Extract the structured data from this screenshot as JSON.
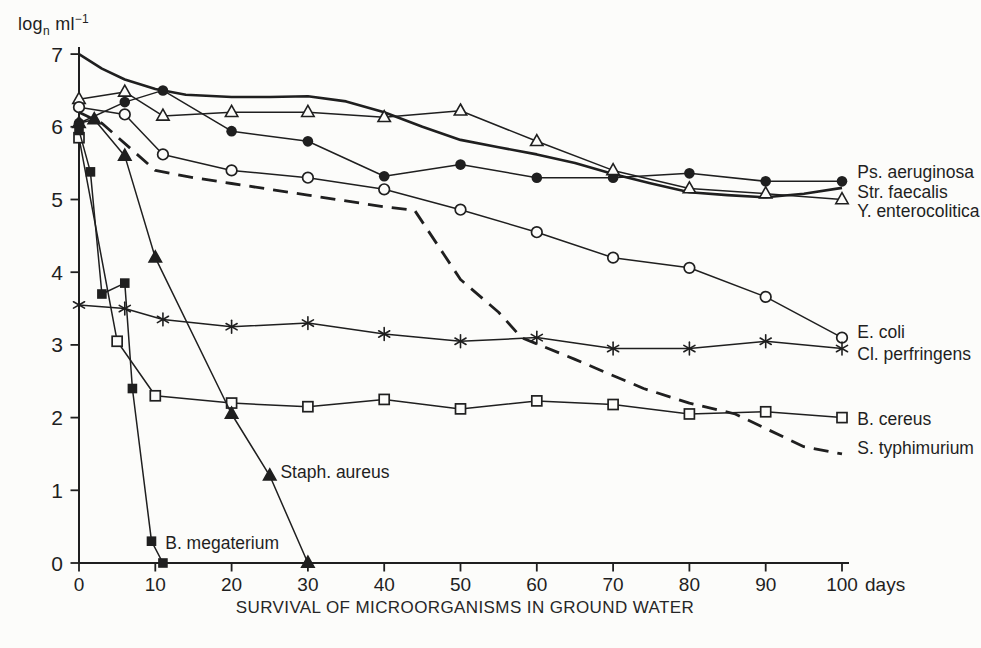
{
  "figure": {
    "y_axis_unit": {
      "prefix": "log",
      "sub": "n",
      "mid": " ml",
      "sup": "−1"
    },
    "caption": "SURVIVAL OF MICROORGANISMS IN GROUND WATER"
  },
  "chart_data": {
    "type": "line",
    "title": "SURVIVAL OF MICROORGANISMS IN GROUND WATER",
    "xlabel": "days",
    "ylabel": "log_n ml^-1",
    "xlim": [
      0,
      100
    ],
    "ylim": [
      0,
      7
    ],
    "x_ticks": [
      0,
      10,
      20,
      30,
      40,
      50,
      60,
      70,
      80,
      90,
      100
    ],
    "y_ticks": [
      0,
      1,
      2,
      3,
      4,
      5,
      6,
      7
    ],
    "grid": false,
    "legend_position": "right-end-labels",
    "ink_color": "#1f1f1f",
    "background": "#fcfcfa",
    "series": [
      {
        "name": "Str. faecalis",
        "marker": "none",
        "line": "solid",
        "width": 2.6,
        "points": [
          [
            0,
            7.0
          ],
          [
            3,
            6.8
          ],
          [
            6,
            6.65
          ],
          [
            10,
            6.52
          ],
          [
            14,
            6.44
          ],
          [
            20,
            6.41
          ],
          [
            25,
            6.41
          ],
          [
            30,
            6.42
          ],
          [
            35,
            6.35
          ],
          [
            40,
            6.2
          ],
          [
            45,
            6.0
          ],
          [
            50,
            5.82
          ],
          [
            55,
            5.72
          ],
          [
            60,
            5.62
          ],
          [
            65,
            5.5
          ],
          [
            70,
            5.35
          ],
          [
            75,
            5.22
          ],
          [
            80,
            5.1
          ],
          [
            85,
            5.06
          ],
          [
            90,
            5.03
          ],
          [
            95,
            5.08
          ],
          [
            100,
            5.16
          ]
        ],
        "label_anchor": [
          102,
          5.1
        ]
      },
      {
        "name": "Ps. aeruginosa",
        "marker": "circle-filled",
        "line": "solid",
        "points": [
          [
            0,
            6.05
          ],
          [
            6,
            6.34
          ],
          [
            11,
            6.5
          ],
          [
            20,
            5.94
          ],
          [
            30,
            5.8
          ],
          [
            40,
            5.32
          ],
          [
            50,
            5.48
          ],
          [
            60,
            5.3
          ],
          [
            70,
            5.3
          ],
          [
            80,
            5.36
          ],
          [
            90,
            5.25
          ],
          [
            100,
            5.25
          ]
        ],
        "label_anchor": [
          102,
          5.38
        ]
      },
      {
        "name": "Y. enterocolitica",
        "marker": "triangle-open",
        "line": "solid",
        "points": [
          [
            0,
            6.38
          ],
          [
            6,
            6.48
          ],
          [
            11,
            6.15
          ],
          [
            20,
            6.2
          ],
          [
            30,
            6.2
          ],
          [
            40,
            6.13
          ],
          [
            50,
            6.22
          ],
          [
            60,
            5.8
          ],
          [
            70,
            5.4
          ],
          [
            80,
            5.15
          ],
          [
            90,
            5.08
          ],
          [
            100,
            5.0
          ]
        ],
        "label_anchor": [
          102,
          4.84
        ]
      },
      {
        "name": "E. coli",
        "marker": "circle-open",
        "line": "solid",
        "points": [
          [
            0,
            6.27
          ],
          [
            6,
            6.17
          ],
          [
            11,
            5.62
          ],
          [
            20,
            5.4
          ],
          [
            30,
            5.3
          ],
          [
            40,
            5.14
          ],
          [
            50,
            4.86
          ],
          [
            60,
            4.55
          ],
          [
            70,
            4.2
          ],
          [
            80,
            4.06
          ],
          [
            90,
            3.66
          ],
          [
            100,
            3.1
          ]
        ],
        "label_anchor": [
          102,
          3.18
        ]
      },
      {
        "name": "Cl. perfringens",
        "marker": "asterisk",
        "line": "solid",
        "points": [
          [
            0,
            3.55
          ],
          [
            6,
            3.5
          ],
          [
            11,
            3.35
          ],
          [
            20,
            3.25
          ],
          [
            30,
            3.3
          ],
          [
            40,
            3.15
          ],
          [
            50,
            3.05
          ],
          [
            60,
            3.1
          ],
          [
            70,
            2.95
          ],
          [
            80,
            2.95
          ],
          [
            90,
            3.05
          ],
          [
            100,
            2.95
          ]
        ],
        "label_anchor": [
          102,
          2.88
        ]
      },
      {
        "name": "B. cereus",
        "marker": "square-open",
        "line": "solid",
        "points": [
          [
            0,
            5.85
          ],
          [
            5,
            3.05
          ],
          [
            10,
            2.3
          ],
          [
            20,
            2.2
          ],
          [
            30,
            2.15
          ],
          [
            40,
            2.25
          ],
          [
            50,
            2.12
          ],
          [
            60,
            2.23
          ],
          [
            70,
            2.18
          ],
          [
            80,
            2.05
          ],
          [
            90,
            2.08
          ],
          [
            100,
            2.0
          ]
        ],
        "label_anchor": [
          102,
          1.98
        ]
      },
      {
        "name": "S. typhimurium",
        "marker": "none",
        "line": "dashed",
        "points": [
          [
            0,
            6.2
          ],
          [
            3,
            6.05
          ],
          [
            10,
            5.4
          ],
          [
            15,
            5.3
          ],
          [
            20,
            5.22
          ],
          [
            30,
            5.06
          ],
          [
            40,
            4.9
          ],
          [
            44,
            4.85
          ],
          [
            50,
            3.9
          ],
          [
            55,
            3.45
          ],
          [
            58,
            3.1
          ],
          [
            65,
            2.8
          ],
          [
            74,
            2.4
          ],
          [
            80,
            2.2
          ],
          [
            86,
            2.05
          ],
          [
            95,
            1.6
          ],
          [
            100,
            1.5
          ]
        ],
        "label_anchor": [
          102,
          1.58
        ]
      },
      {
        "name": "Staph. aureus",
        "marker": "triangle-filled",
        "line": "solid",
        "points": [
          [
            0,
            6.05
          ],
          [
            2,
            6.1
          ],
          [
            6,
            5.6
          ],
          [
            10,
            4.2
          ],
          [
            20,
            2.05
          ],
          [
            25,
            1.2
          ],
          [
            30,
            0
          ]
        ],
        "label_anchor": [
          26.4,
          1.25
        ]
      },
      {
        "name": "B. megaterium",
        "marker": "square-filled",
        "line": "solid",
        "points": [
          [
            0,
            5.95
          ],
          [
            1.5,
            5.38
          ],
          [
            3,
            3.7
          ],
          [
            6,
            3.85
          ],
          [
            7,
            2.4
          ],
          [
            9.5,
            0.3
          ],
          [
            11,
            0
          ]
        ],
        "label_anchor": [
          11.3,
          0.28
        ]
      }
    ]
  }
}
